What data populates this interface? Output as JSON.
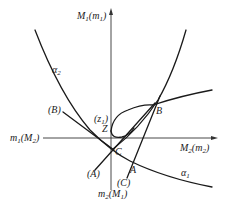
{
  "diagram": {
    "axes": {
      "vertical_top": {
        "main": "M",
        "main_sub": "1",
        "paren": "m",
        "paren_sub": "1"
      },
      "vertical_bottom": {
        "main": "m",
        "main_sub": "2",
        "paren": "M",
        "paren_sub": "1"
      },
      "horizontal_left": {
        "main": "m",
        "main_sub": "1",
        "paren": "M",
        "paren_sub": "2"
      },
      "horizontal_right": {
        "main": "M",
        "main_sub": "2",
        "paren": "m",
        "paren_sub": "2"
      }
    },
    "curves": {
      "alpha1": {
        "symbol": "α",
        "sub": "1"
      },
      "alpha2": {
        "symbol": "α",
        "sub": "2"
      }
    },
    "points": {
      "A": "A",
      "B": "B",
      "C": "C",
      "Z": "Z"
    },
    "line_labels": {
      "A": "(A)",
      "B": "(B)",
      "C": "(C)",
      "z1": {
        "text": "(z",
        "sub": "1",
        "close": ")"
      }
    },
    "colors": {
      "stroke": "#1a1a1a",
      "background": "#ffffff"
    }
  }
}
